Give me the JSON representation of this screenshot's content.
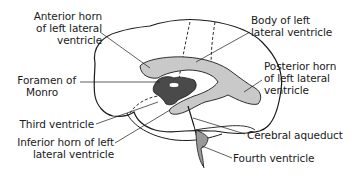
{
  "colors": {
    "outline": "#1a1a1a",
    "lateral_ventricle_fill": "#c9c9c9",
    "third_ventricle_fill": "#4a4a4a",
    "fourth_ventricle_fill": "#9a9a9a",
    "background": "#ffffff"
  },
  "labels": {
    "anterior_horn": [
      "Anterior horn",
      "of left lateral",
      "ventricle"
    ],
    "body_left": [
      "Body of left",
      "lateral ventricle"
    ],
    "foramen_monro": [
      "Foramen of",
      "Monro"
    ],
    "posterior_horn": [
      "Posterior horn",
      "of left lateral",
      "ventricle"
    ],
    "third_ventricle": [
      "Third ventricle"
    ],
    "inferior_horn": [
      "Inferior horn of left",
      "lateral ventricle"
    ],
    "cerebral_aqueduct": [
      "Cerebral aqueduct"
    ],
    "fourth_ventricle": [
      "Fourth ventricle"
    ]
  }
}
